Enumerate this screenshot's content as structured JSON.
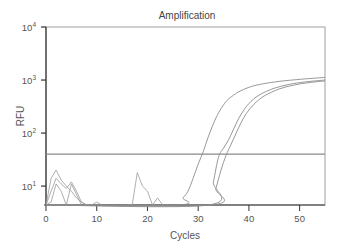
{
  "chart_data": {
    "type": "line",
    "title": "Amplification",
    "xlabel": "Cycles",
    "ylabel": "RFU",
    "yscale": "log",
    "xlim": [
      0,
      55
    ],
    "ylim": [
      4.4,
      10000
    ],
    "x_ticks": [
      0,
      10,
      20,
      30,
      40,
      50
    ],
    "x_tick_labels": [
      "0",
      "10",
      "20",
      "30",
      "40",
      "50"
    ],
    "y_ticks": [
      10,
      100,
      1000,
      10000
    ],
    "y_tick_labels": [
      {
        "base": "10",
        "exp": "1"
      },
      {
        "base": "10",
        "exp": "2"
      },
      {
        "base": "10",
        "exp": "3"
      },
      {
        "base": "10",
        "exp": "4"
      }
    ],
    "grid": false,
    "legend": null,
    "threshold": {
      "value": 40,
      "label": "threshold"
    },
    "series": [
      {
        "name": "Sample 1",
        "x": [
          0,
          26,
          27,
          28,
          29,
          30,
          31,
          32,
          33,
          34,
          35,
          36,
          38,
          40,
          42,
          45,
          48,
          51,
          55
        ],
        "y": [
          4.4,
          4.4,
          6,
          8,
          14,
          26,
          45,
          85,
          150,
          240,
          340,
          440,
          600,
          730,
          820,
          920,
          990,
          1050,
          1120
        ]
      },
      {
        "name": "Sample 2",
        "x": [
          0,
          32,
          33,
          34,
          35,
          36,
          37,
          38,
          39,
          40,
          42,
          45,
          48,
          51,
          55
        ],
        "y": [
          4.4,
          4.4,
          12,
          35,
          52,
          75,
          120,
          190,
          270,
          360,
          520,
          700,
          830,
          920,
          1000
        ]
      },
      {
        "name": "Sample 3",
        "x": [
          0,
          32.5,
          33.5,
          34.5,
          35.5,
          36.5,
          37.5,
          38.5,
          39.5,
          41,
          43,
          46,
          49,
          52,
          55
        ],
        "y": [
          4.4,
          4.4,
          9,
          20,
          38,
          62,
          100,
          160,
          235,
          350,
          500,
          680,
          810,
          900,
          960
        ]
      }
    ],
    "noise_traces": [
      {
        "x": [
          0,
          1,
          2,
          3,
          4,
          5,
          6,
          7,
          8,
          9
        ],
        "y": [
          4.4,
          14,
          20,
          13,
          10,
          8,
          6,
          5,
          4.4,
          4.4
        ]
      },
      {
        "x": [
          0,
          1,
          2,
          3,
          4,
          5,
          6,
          7,
          8
        ],
        "y": [
          4.4,
          8,
          14,
          11,
          9,
          12,
          8,
          5,
          4.4
        ]
      },
      {
        "x": [
          0,
          1,
          2,
          3,
          4,
          5,
          6,
          7
        ],
        "y": [
          4.4,
          5,
          11,
          8,
          4.4,
          11,
          7,
          4.4
        ]
      },
      {
        "x": [
          8,
          9,
          10,
          11
        ],
        "y": [
          4.4,
          4.4,
          5,
          4.4
        ]
      },
      {
        "x": [
          16,
          17,
          18,
          19,
          20,
          21,
          22,
          23,
          24
        ],
        "y": [
          4.4,
          4.4,
          18,
          10,
          8,
          4.4,
          6,
          4.4,
          4.4
        ]
      }
    ]
  }
}
